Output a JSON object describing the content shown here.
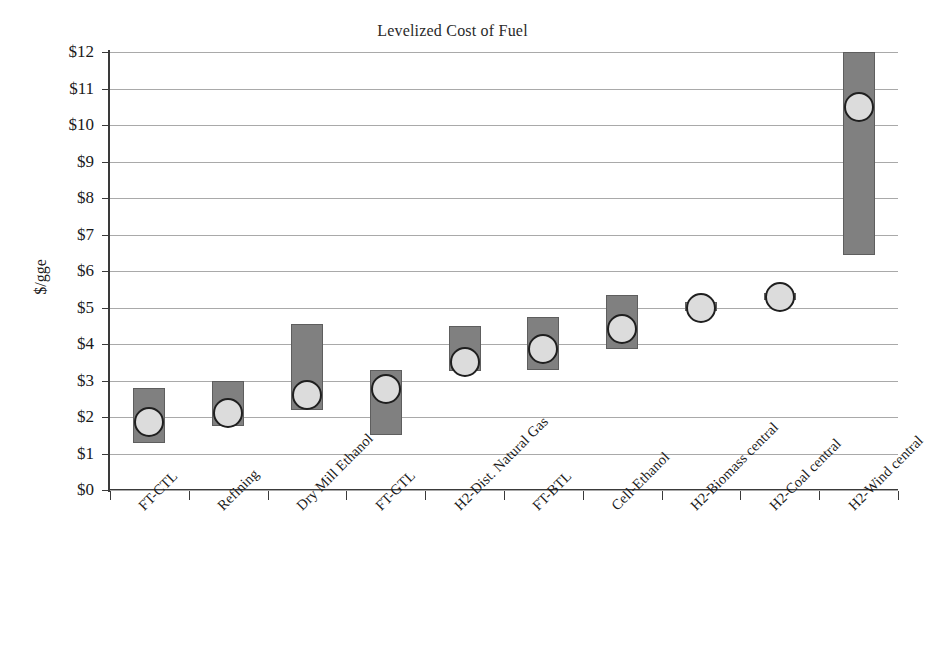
{
  "chart_data": {
    "type": "bar",
    "title": "Levelized Cost of Fuel",
    "xlabel": "",
    "ylabel": "$/gge",
    "ylim": [
      0,
      12
    ],
    "ytick_step": 1,
    "grid": true,
    "legend": "none",
    "categories": [
      "FT-CTL",
      "Refining",
      "Dry Mill Ethanol",
      "FT-GTL",
      "H2-Dist. Natural Gas",
      "FT-BTL",
      "Cell-Ethanol",
      "H2-Biomass central",
      "H2-Coal central",
      "H2-Wind central"
    ],
    "ytick_labels": [
      "$12",
      "$11",
      "$10",
      "$9",
      "$8",
      "$7",
      "$6",
      "$5",
      "$4",
      "$3",
      "$2",
      "$1",
      "$0"
    ],
    "series": [
      {
        "name": "Cost range",
        "type": "range-bar",
        "low": [
          1.3,
          1.75,
          2.2,
          1.5,
          3.25,
          3.3,
          3.85,
          4.9,
          5.2,
          6.45
        ],
        "high": [
          2.8,
          3.0,
          4.55,
          3.3,
          4.5,
          4.75,
          5.35,
          5.15,
          5.4,
          12.0
        ]
      },
      {
        "name": "Point estimate",
        "type": "marker",
        "values": [
          1.85,
          2.1,
          2.6,
          2.78,
          3.5,
          3.85,
          4.4,
          5.0,
          5.3,
          10.5
        ]
      }
    ],
    "colors": {
      "bar_fill": "#808080",
      "bar_stroke": "#5e5e5e",
      "marker_fill": "#dcdcdc",
      "marker_stroke": "#1f1f1f",
      "gridline": "#a9a9a9",
      "axis": "#3a3a3a",
      "text": "#1a1a1a"
    }
  }
}
